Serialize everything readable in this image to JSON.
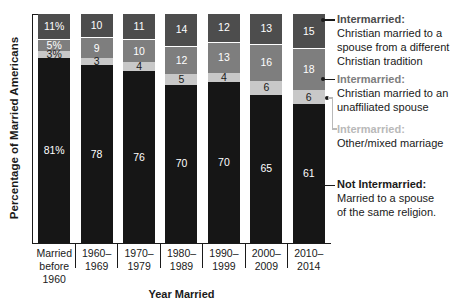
{
  "chart_data": {
    "type": "bar",
    "stacked": true,
    "orientation": "vertical",
    "unit": "%",
    "xlabel": "Year Married",
    "ylabel": "Percentage of Married Americans",
    "ylim": [
      0,
      100
    ],
    "grid": false,
    "legend_position": "right",
    "categories": [
      "Married before 1960",
      "1960–1969",
      "1970–1979",
      "1980–1989",
      "1990–1999",
      "2000–2009",
      "2010–2014"
    ],
    "category_label_lines": [
      [
        "Married",
        "before",
        "1960"
      ],
      [
        "1960–",
        "1969"
      ],
      [
        "1970–",
        "1979"
      ],
      [
        "1980–",
        "1989"
      ],
      [
        "1990–",
        "1999"
      ],
      [
        "2000–",
        "2009"
      ],
      [
        "2010–",
        "2014"
      ]
    ],
    "series": [
      {
        "name": "Intermarried: Christian married to a spouse from a different Christian tradition",
        "color": "#4d4d4d",
        "label_color": "#ffffff",
        "values": [
          11,
          10,
          11,
          14,
          12,
          13,
          15
        ],
        "value_labels": [
          "11%",
          "10",
          "11",
          "14",
          "12",
          "13",
          "15"
        ]
      },
      {
        "name": "Intermarried: Christian married to an unaffiliated spouse",
        "color": "#7e7e7e",
        "label_color": "#ffffff",
        "values": [
          5,
          9,
          10,
          12,
          13,
          16,
          18
        ],
        "value_labels": [
          "5%",
          "9",
          "10",
          "12",
          "13",
          "16",
          "18"
        ]
      },
      {
        "name": "Intermarried: Other/mixed marriage",
        "color": "#c8c8c8",
        "label_color": "#1a1a1a",
        "values": [
          3,
          3,
          4,
          5,
          4,
          6,
          6
        ],
        "value_labels": [
          "3%",
          "3",
          "4",
          "5",
          "4",
          "6",
          "6"
        ]
      },
      {
        "name": "Not Intermarried: Married to a spouse of the same religion.",
        "color": "#161616",
        "label_color": "#ffffff",
        "values": [
          81,
          78,
          76,
          70,
          70,
          65,
          61
        ],
        "value_labels": [
          "81%",
          "78",
          "76",
          "70",
          "70",
          "65",
          "61"
        ]
      }
    ]
  },
  "legend": {
    "entries": [
      {
        "heading": "Intermarried:",
        "heading_color": "#4d4d4d",
        "lines": [
          "Christian married to a",
          "spouse from a different",
          "Christian tradition"
        ]
      },
      {
        "heading": "Intermarried:",
        "heading_color": "#7e7e7e",
        "lines": [
          "Christian married to an",
          "unaffiliated spouse"
        ]
      },
      {
        "heading": "Intermarried:",
        "heading_color": "#b9b9b9",
        "lines": [
          "Other/mixed marriage"
        ]
      },
      {
        "heading": "Not Intermarried:",
        "heading_color": "#1a1a1a",
        "lines": [
          "Married to a spouse",
          "of the same religion."
        ]
      }
    ]
  }
}
